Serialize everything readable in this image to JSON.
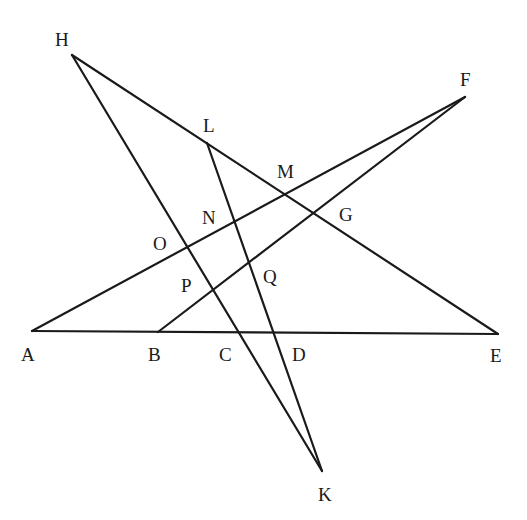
{
  "diagram": {
    "type": "geometry",
    "points": {
      "H": {
        "label": "H",
        "x": 72,
        "y": 55
      },
      "F": {
        "label": "F",
        "x": 465,
        "y": 97
      },
      "L": {
        "label": "L",
        "x": 207,
        "y": 143
      },
      "M": {
        "label": "M",
        "x": 285,
        "y": 193
      },
      "N": {
        "label": "N",
        "x": 235,
        "y": 220
      },
      "G": {
        "label": "G",
        "x": 314,
        "y": 212
      },
      "O": {
        "label": "O",
        "x": 187,
        "y": 244
      },
      "P": {
        "label": "P",
        "x": 211,
        "y": 290
      },
      "Q": {
        "label": "Q",
        "x": 249,
        "y": 266
      },
      "A": {
        "label": "A",
        "x": 32,
        "y": 331
      },
      "B": {
        "label": "B",
        "x": 158,
        "y": 332
      },
      "C": {
        "label": "C",
        "x": 237,
        "y": 332
      },
      "D": {
        "label": "D",
        "x": 273,
        "y": 333
      },
      "E": {
        "label": "E",
        "x": 498,
        "y": 334
      },
      "K": {
        "label": "K",
        "x": 322,
        "y": 471
      }
    },
    "segments": [
      [
        "H",
        "E"
      ],
      [
        "H",
        "K"
      ],
      [
        "L",
        "K"
      ],
      [
        "A",
        "F"
      ],
      [
        "B",
        "F"
      ],
      [
        "A",
        "E"
      ]
    ]
  }
}
